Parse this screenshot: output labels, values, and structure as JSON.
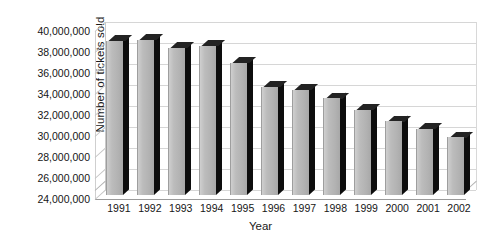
{
  "chart_data": {
    "type": "bar",
    "title": "",
    "xlabel": "Year",
    "ylabel": "Number of tickets sold",
    "categories": [
      "1991",
      "1992",
      "1993",
      "1994",
      "1995",
      "1996",
      "1997",
      "1998",
      "1999",
      "2000",
      "2001",
      "2002"
    ],
    "values": [
      38700000,
      38800000,
      38000000,
      38200000,
      36600000,
      34300000,
      34000000,
      33200000,
      32100000,
      31000000,
      30300000,
      29500000
    ],
    "ylim": [
      24000000,
      40000000
    ],
    "ytick_step": 2000000,
    "ytick_labels": [
      "40,000,000",
      "38,000,000",
      "36,000,000",
      "34,000,000",
      "32,000,000",
      "30,000,000",
      "28,000,000",
      "26,000,000",
      "24,000,000"
    ],
    "ytick_values": [
      40000000,
      38000000,
      36000000,
      34000000,
      32000000,
      30000000,
      28000000,
      26000000,
      24000000
    ],
    "grid": true,
    "legend": "none",
    "style": "3d-column",
    "colors": {
      "bar_face": "#b8b8b8",
      "bar_side": "#0d0d0d",
      "bar_top": "#232323",
      "gridline": "#d6d6d6",
      "axis": "#9a9a9a",
      "text": "#161616",
      "background": "#ffffff"
    }
  }
}
